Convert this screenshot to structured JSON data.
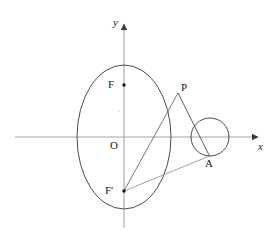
{
  "figure": {
    "width": 278,
    "height": 249,
    "background_color": "#ffffff",
    "stroke_color": "#3a3a3a",
    "axis_color": "#9a9a9a",
    "label_color": "#1a1a1a"
  },
  "axes": {
    "x_label": "x",
    "y_label": "y",
    "origin_label": "O",
    "origin": {
      "x": 124,
      "y": 137
    },
    "x_axis": {
      "x1": 15,
      "y1": 137,
      "x2": 263,
      "y2": 137
    },
    "y_axis": {
      "x1": 124,
      "y1": 228,
      "x2": 124,
      "y2": 18
    }
  },
  "ellipse": {
    "center": {
      "x": 124,
      "y": 137
    },
    "semi_axis_x": 47,
    "semi_axis_y": 72
  },
  "circle": {
    "center": {
      "x": 210,
      "y": 137
    },
    "radius": 19
  },
  "points": [
    {
      "name": "F",
      "label": "F",
      "x": 124,
      "y": 85,
      "label_x": 108,
      "label_y": 79,
      "dot": true
    },
    {
      "name": "F2",
      "label": "F′",
      "x": 124,
      "y": 191,
      "label_x": 106,
      "label_y": 185,
      "dot": true
    },
    {
      "name": "P",
      "label": "P",
      "x": 178,
      "y": 93,
      "label_x": 181,
      "label_y": 82,
      "dot": false
    },
    {
      "name": "A",
      "label": "A",
      "x": 209,
      "y": 156,
      "label_x": 205,
      "label_y": 158,
      "dot": false
    },
    {
      "name": "O",
      "label": "O",
      "x": 124,
      "y": 137,
      "label_x": 110,
      "label_y": 140,
      "dot": false
    }
  ],
  "segments": [
    {
      "name": "segment-p-to-fprime",
      "x1": 178,
      "y1": 93,
      "x2": 124,
      "y2": 191
    },
    {
      "name": "segment-p-to-a",
      "x1": 178,
      "y1": 93,
      "x2": 209,
      "y2": 156
    },
    {
      "name": "segment-fprime-to-a",
      "x1": 124,
      "y1": 191,
      "x2": 209,
      "y2": 156
    }
  ]
}
